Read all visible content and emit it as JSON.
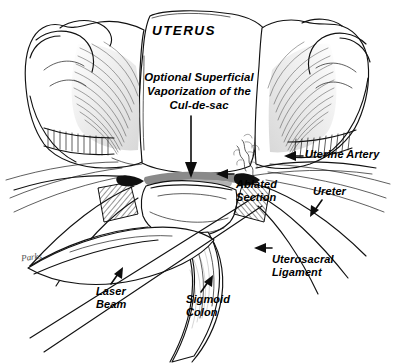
{
  "figure": {
    "title": "UTERUS",
    "background_color": "#ffffff",
    "ink_color": "#111111",
    "vaporization_band_color": "#8a8a8a",
    "width": 397,
    "height": 364
  },
  "caption": {
    "vaporization_note": "Optional Superficial\nVaporization of the\nCul-de-sac"
  },
  "labels": {
    "uterine_artery": "Uterine Artery",
    "ureter": "Ureter",
    "ablated_section": "Ablated\nSection",
    "uterosacral_ligament": "Uterosacral\nLigament",
    "laser_beam": "Laser\nBeam",
    "sigmoid_colon": "Sigmoid\nColon"
  },
  "signature": {
    "artist": "Parks"
  },
  "pointers": [
    {
      "name": "vaporization-down-arrow",
      "target": "cul-de-sac vaporization band",
      "direction": "down"
    },
    {
      "name": "uterine-artery-arrow",
      "target": "uterine artery",
      "direction": "left"
    },
    {
      "name": "ureter-arrow",
      "target": "ureter",
      "direction": "down-left"
    },
    {
      "name": "ablated-section-arrow",
      "target": "ablated section",
      "direction": "left"
    },
    {
      "name": "uterosacral-ligament-arrow",
      "target": "uterosacral ligament",
      "direction": "left"
    },
    {
      "name": "laser-beam-arrow",
      "target": "laser beam",
      "direction": "up-right"
    },
    {
      "name": "sigmoid-colon-arrow",
      "target": "sigmoid colon",
      "direction": "up-right"
    }
  ]
}
